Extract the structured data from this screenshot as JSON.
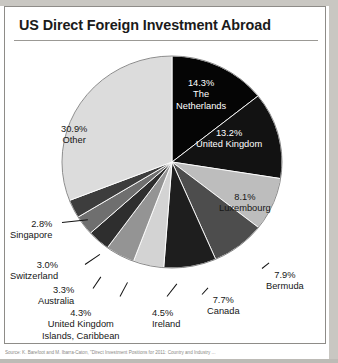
{
  "page": {
    "title": "US Direct Foreign Investment Abroad",
    "source_note": "Source: K. Barefoot and M. Ibarra-Caton, \"Direct Investment Positions for 2011: Country and Industry ..."
  },
  "chart_data": {
    "type": "pie",
    "title": "US Direct Foreign Investment Abroad",
    "unit": "%",
    "start_angle_deg": 0,
    "direction": "clockwise",
    "legend": "none (labels placed on/around slices)",
    "categories": [
      "The Netherlands",
      "United Kingdom",
      "Luxembourg",
      "Bermuda",
      "Canada",
      "Ireland",
      "United Kingdom Islands, Caribbean",
      "Australia",
      "Switzerland",
      "Singapore",
      "Other"
    ],
    "values": [
      14.3,
      13.2,
      8.1,
      7.9,
      7.7,
      4.5,
      4.3,
      3.3,
      3.0,
      2.8,
      30.9
    ],
    "colors": [
      "#050505",
      "#121212",
      "#bdbdbd",
      "#4d4d4d",
      "#1e1e1e",
      "#d3d3d3",
      "#949494",
      "#2e2e2e",
      "#6f6f6f",
      "#3d3d3d",
      "#dcdcdc"
    ],
    "slices": [
      {
        "label": "The Netherlands",
        "value": 14.3,
        "display": "14.3%",
        "color": "#050505",
        "text_color": "#ffffff",
        "label_position": "inside"
      },
      {
        "label": "United Kingdom",
        "value": 13.2,
        "display": "13.2%",
        "color": "#121212",
        "text_color": "#ffffff",
        "label_position": "inside"
      },
      {
        "label": "Luxembourg",
        "value": 8.1,
        "display": "8.1%",
        "color": "#bdbdbd",
        "text_color": "#161616",
        "label_position": "inside"
      },
      {
        "label": "Bermuda",
        "value": 7.9,
        "display": "7.9%",
        "color": "#4d4d4d",
        "text_color": "#161616",
        "label_position": "outside"
      },
      {
        "label": "Canada",
        "value": 7.7,
        "display": "7.7%",
        "color": "#1e1e1e",
        "text_color": "#161616",
        "label_position": "outside"
      },
      {
        "label": "Ireland",
        "value": 4.5,
        "display": "4.5%",
        "color": "#d3d3d3",
        "text_color": "#161616",
        "label_position": "outside"
      },
      {
        "label": "United Kingdom Islands, Caribbean",
        "value": 4.3,
        "display": "4.3%",
        "color": "#949494",
        "text_color": "#161616",
        "label_position": "outside"
      },
      {
        "label": "Australia",
        "value": 3.3,
        "display": "3.3%",
        "color": "#2e2e2e",
        "text_color": "#161616",
        "label_position": "outside"
      },
      {
        "label": "Switzerland",
        "value": 3.0,
        "display": "3.0%",
        "color": "#6f6f6f",
        "text_color": "#161616",
        "label_position": "outside"
      },
      {
        "label": "Singapore",
        "value": 2.8,
        "display": "2.8%",
        "color": "#3d3d3d",
        "text_color": "#161616",
        "label_position": "outside"
      },
      {
        "label": "Other",
        "value": 30.9,
        "display": "30.9%",
        "color": "#dcdcdc",
        "text_color": "#161616",
        "label_position": "inside"
      }
    ]
  },
  "labels": {
    "netherlands_pct": "14.3%",
    "netherlands_l1": "The",
    "netherlands_l2": "Netherlands",
    "uk_pct": "13.2%",
    "uk_name": "United Kingdom",
    "lux_pct": "8.1%",
    "lux_name": "Luxembourg",
    "bermuda_pct": "7.9%",
    "bermuda_name": "Bermuda",
    "canada_pct": "7.7%",
    "canada_name": "Canada",
    "ireland_pct": "4.5%",
    "ireland_name": "Ireland",
    "ukic_pct": "4.3%",
    "ukic_l1": "United Kingdom",
    "ukic_l2": "Islands, Caribbean",
    "australia_pct": "3.3%",
    "australia_name": "Australia",
    "switzerland_pct": "3.0%",
    "switzerland_name": "Switzerland",
    "singapore_pct": "2.8%",
    "singapore_name": "Singapore",
    "other_pct": "30.9%",
    "other_name": "Other"
  }
}
